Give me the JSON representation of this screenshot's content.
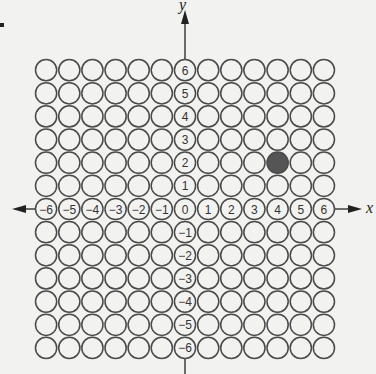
{
  "diagram": {
    "type": "coordinate-grid",
    "grid": {
      "columns": 13,
      "rows": 13,
      "x_min": -6,
      "x_max": 6,
      "y_min": -6,
      "y_max": 6,
      "origin_px": [
        185,
        209
      ],
      "cell_px": 23.15,
      "circle_radius_px": 10.6,
      "stroke_color": "#4a4a4a",
      "fill_color": "#f2f2f0"
    },
    "axes": {
      "x_label": "x",
      "y_label": "y",
      "x_tick_labels": [
        "-6",
        "-5",
        "-4",
        "-3",
        "-2",
        "-1",
        "0",
        "1",
        "2",
        "3",
        "4",
        "5",
        "6"
      ],
      "y_tick_labels": [
        "6",
        "5",
        "4",
        "3",
        "2",
        "1",
        "-1",
        "-2",
        "-3",
        "-4",
        "-5",
        "-6"
      ]
    },
    "highlighted_points": [
      {
        "x": 4,
        "y": 2,
        "color": "#555555"
      }
    ],
    "corner_mark": "•"
  }
}
